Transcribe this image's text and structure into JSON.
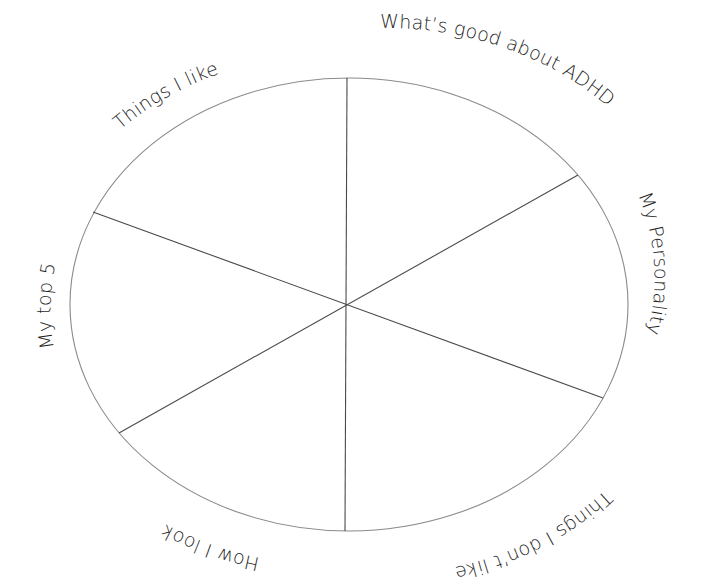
{
  "diagram": {
    "type": "segmented-wheel",
    "segment_count": 6,
    "colors": {
      "background": "#ffffff",
      "outline": "#8a8a8a",
      "spokes": "#4a4a4a",
      "text": "#1e1e1e"
    },
    "segments": [
      {
        "position": "top-left",
        "label": "Things I like"
      },
      {
        "position": "top-right",
        "label": "What’s good about ADHD"
      },
      {
        "position": "right",
        "label": "My Personality"
      },
      {
        "position": "bottom-right",
        "label": "Things I don’t like"
      },
      {
        "position": "bottom-left",
        "label": "How I look"
      },
      {
        "position": "left",
        "label": "My top 5"
      }
    ]
  }
}
